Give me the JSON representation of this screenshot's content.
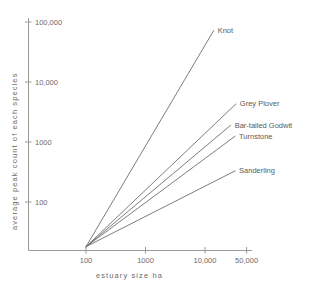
{
  "chart_data": {
    "type": "line",
    "title": "",
    "xlabel": "estuary  size  ha",
    "ylabel": "average  peak  count  of  each  species",
    "xscale": "log",
    "yscale": "log",
    "xlim": [
      50,
      100000
    ],
    "ylim": [
      10,
      100000
    ],
    "grid": false,
    "legend_position": "inline-right-end-of-line",
    "x_ticks": [
      {
        "value": 100,
        "label": "100"
      },
      {
        "value": 1000,
        "label": "1000"
      },
      {
        "value": 10000,
        "label": "10,000"
      },
      {
        "value": 50000,
        "label": "50,000"
      }
    ],
    "y_ticks": [
      {
        "value": 100,
        "label": "100"
      },
      {
        "value": 1000,
        "label": "1000"
      },
      {
        "value": 10000,
        "label": "10,000"
      },
      {
        "value": 100000,
        "label": "100,000"
      }
    ],
    "series": [
      {
        "name": "Knot",
        "label": "Knot",
        "x": [
          100,
          14000
        ],
        "y": [
          18,
          72000
        ],
        "label_x": 14000,
        "label_y": 72000
      },
      {
        "name": "Grey Plover",
        "label": "Grey Plover",
        "x": [
          100,
          33000
        ],
        "y": [
          18,
          4300
        ],
        "label_x": 33000,
        "label_y": 4300
      },
      {
        "name": "Bar-tailed Godwit",
        "label": "Bar-tailed Godwit",
        "x": [
          100,
          27000
        ],
        "y": [
          18,
          1900
        ],
        "label_x": 27000,
        "label_y": 1900
      },
      {
        "name": "Turnstone",
        "label": "Turnstone",
        "x": [
          100,
          32000
        ],
        "y": [
          18,
          1250
        ],
        "label_x": 32000,
        "label_y": 1250
      },
      {
        "name": "Sanderling",
        "label": "Sanderling",
        "x": [
          100,
          32000
        ],
        "y": [
          18,
          330
        ],
        "label_x": 32000,
        "label_y": 330
      }
    ]
  }
}
